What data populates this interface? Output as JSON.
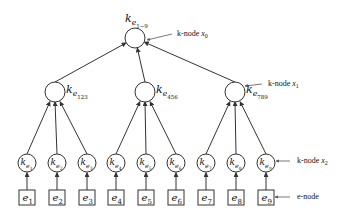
{
  "diagram": {
    "type": "tree",
    "root": {
      "id": "root",
      "label": "k",
      "sub": "e",
      "subsub": "1−9",
      "x": 135,
      "y": 38,
      "r": 10
    },
    "mid": [
      {
        "id": "m1",
        "label": "k",
        "sub": "e",
        "subsub": "123",
        "x": 55,
        "y": 92,
        "r": 10,
        "children": [
          "l1",
          "l2",
          "l3"
        ]
      },
      {
        "id": "m2",
        "label": "k",
        "sub": "e",
        "subsub": "456",
        "x": 145,
        "y": 92,
        "r": 10,
        "children": [
          "l4",
          "l5",
          "l6"
        ]
      },
      {
        "id": "m3",
        "label": "k",
        "sub": "e",
        "subsub": "789",
        "x": 235,
        "y": 92,
        "r": 10,
        "children": [
          "l7",
          "l8",
          "l9"
        ]
      }
    ],
    "leaves": [
      {
        "id": "l1",
        "label": "k",
        "sub": "e",
        "subsub": "1",
        "x": 27
      },
      {
        "id": "l2",
        "label": "k",
        "sub": "e",
        "subsub": "2",
        "x": 57
      },
      {
        "id": "l3",
        "label": "k",
        "sub": "e",
        "subsub": "3",
        "x": 87
      },
      {
        "id": "l4",
        "label": "k",
        "sub": "e",
        "subsub": "4",
        "x": 116
      },
      {
        "id": "l5",
        "label": "k",
        "sub": "e",
        "subsub": "5",
        "x": 146
      },
      {
        "id": "l6",
        "label": "k",
        "sub": "e",
        "subsub": "6",
        "x": 176
      },
      {
        "id": "l7",
        "label": "k",
        "sub": "e",
        "subsub": "7",
        "x": 206
      },
      {
        "id": "l8",
        "label": "k",
        "sub": "e",
        "subsub": "8",
        "x": 236
      },
      {
        "id": "l9",
        "label": "k",
        "sub": "e",
        "subsub": "9",
        "x": 266
      }
    ],
    "leaf_y": 163,
    "leaf_r": 9,
    "enodes": [
      {
        "id": "e1",
        "label": "e",
        "sub": "1"
      },
      {
        "id": "e2",
        "label": "e",
        "sub": "2"
      },
      {
        "id": "e3",
        "label": "e",
        "sub": "3"
      },
      {
        "id": "e4",
        "label": "e",
        "sub": "4"
      },
      {
        "id": "e5",
        "label": "e",
        "sub": "5"
      },
      {
        "id": "e6",
        "label": "e",
        "sub": "6"
      },
      {
        "id": "e7",
        "label": "e",
        "sub": "7"
      },
      {
        "id": "e8",
        "label": "e",
        "sub": "8"
      },
      {
        "id": "e9",
        "label": "e",
        "sub": "9"
      }
    ],
    "enode_y": 190,
    "enode_w": 16,
    "enode_h": 15,
    "annotations": [
      {
        "id": "ann-x0",
        "text": "k-node ",
        "var": "x",
        "sub": "0",
        "tx": 177,
        "ty": 36,
        "from": [
          172,
          34
        ],
        "to": [
          147,
          40
        ]
      },
      {
        "id": "ann-x1",
        "text": "k-node ",
        "var": "x",
        "sub": "1",
        "tx": 268,
        "ty": 86,
        "from": [
          262,
          84
        ],
        "to": [
          245,
          86
        ]
      },
      {
        "id": "ann-x2",
        "text": "k-node ",
        "var": "x",
        "sub": "2",
        "tx": 297,
        "ty": 163,
        "from": [
          290,
          161
        ],
        "to": [
          276,
          161
        ]
      },
      {
        "id": "ann-enode",
        "text": "e-node",
        "var": "",
        "sub": "",
        "tx": 297,
        "ty": 199,
        "from": [
          290,
          197
        ],
        "to": [
          275,
          197
        ]
      }
    ],
    "colors": {
      "stroke": "#333333",
      "text": "#111111",
      "background": "#ffffff"
    }
  }
}
